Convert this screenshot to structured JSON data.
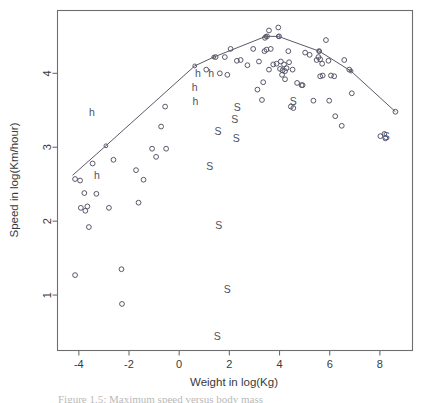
{
  "figure": {
    "caption": "Figure 1.5: Maximum speed versus body mass",
    "background": "#ffffff",
    "frame_color": "#6e6e6e",
    "point_color": "#4f4f62",
    "line_color": "#5a5a6a",
    "text_color": "#3a3a3a"
  },
  "chart_data": {
    "type": "scatter",
    "title": "",
    "xlabel": "Weight in log(Kg)",
    "ylabel": "Speed in log(Km/hour)",
    "xlim": [
      -4.85,
      9.3
    ],
    "ylim": [
      0.25,
      4.85
    ],
    "xticks": [
      -4,
      -2,
      0,
      2,
      4,
      6,
      8
    ],
    "xticklabels": [
      "-4",
      "-2",
      "0",
      "2",
      "4",
      "6",
      "8"
    ],
    "yticks": [
      1,
      2,
      3,
      4
    ],
    "yticklabels": [
      "1",
      "2",
      "3",
      "4"
    ],
    "grid": false,
    "legend": null,
    "series": [
      {
        "name": "observations",
        "marker": "open-circle",
        "points": [
          [
            -4.15,
            2.57
          ],
          [
            -3.95,
            2.55
          ],
          [
            -3.78,
            2.38
          ],
          [
            -3.92,
            2.18
          ],
          [
            -3.74,
            2.14
          ],
          [
            -3.66,
            2.2
          ],
          [
            -3.6,
            1.92
          ],
          [
            -4.15,
            1.27
          ],
          [
            -3.45,
            2.78
          ],
          [
            -3.3,
            2.37
          ],
          [
            -2.8,
            2.18
          ],
          [
            -2.62,
            2.83
          ],
          [
            -2.3,
            1.35
          ],
          [
            -2.28,
            0.88
          ],
          [
            -1.72,
            2.69
          ],
          [
            -1.62,
            2.25
          ],
          [
            -1.42,
            2.56
          ],
          [
            -1.08,
            2.98
          ],
          [
            -0.92,
            2.87
          ],
          [
            -0.72,
            3.28
          ],
          [
            -0.52,
            2.98
          ],
          [
            -0.56,
            3.55
          ],
          [
            1.08,
            4.05
          ],
          [
            1.45,
            4.22
          ],
          [
            1.62,
            4.0
          ],
          [
            1.92,
            3.98
          ],
          [
            2.3,
            4.17
          ],
          [
            2.72,
            4.11
          ],
          [
            2.95,
            4.33
          ],
          [
            3.18,
            4.16
          ],
          [
            3.4,
            4.3
          ],
          [
            3.48,
            4.32
          ],
          [
            3.42,
            4.48
          ],
          [
            3.5,
            4.5
          ],
          [
            3.58,
            4.58
          ],
          [
            3.95,
            4.62
          ],
          [
            3.98,
            4.5
          ],
          [
            3.12,
            3.78
          ],
          [
            3.35,
            3.88
          ],
          [
            3.3,
            3.64
          ],
          [
            3.58,
            4.05
          ],
          [
            3.75,
            4.12
          ],
          [
            3.88,
            4.13
          ],
          [
            4.02,
            4.06
          ],
          [
            4.05,
            4.16
          ],
          [
            4.12,
            4.04
          ],
          [
            4.18,
            4.12
          ],
          [
            4.22,
            4.03
          ],
          [
            4.28,
            4.07
          ],
          [
            4.1,
            3.98
          ],
          [
            4.22,
            3.92
          ],
          [
            4.35,
            4.3
          ],
          [
            4.38,
            4.15
          ],
          [
            4.52,
            4.05
          ],
          [
            4.45,
            3.55
          ],
          [
            4.55,
            3.53
          ],
          [
            4.7,
            3.87
          ],
          [
            4.88,
            3.84
          ],
          [
            4.92,
            3.84
          ],
          [
            5.02,
            4.28
          ],
          [
            5.2,
            4.25
          ],
          [
            5.35,
            3.63
          ],
          [
            5.48,
            4.18
          ],
          [
            5.55,
            4.22
          ],
          [
            5.58,
            4.3
          ],
          [
            5.62,
            4.19
          ],
          [
            5.7,
            4.13
          ],
          [
            5.62,
            3.96
          ],
          [
            5.72,
            3.97
          ],
          [
            5.85,
            4.45
          ],
          [
            5.95,
            4.17
          ],
          [
            5.98,
            3.63
          ],
          [
            6.05,
            3.97
          ],
          [
            6.18,
            3.96
          ],
          [
            6.22,
            3.42
          ],
          [
            6.48,
            3.29
          ],
          [
            6.58,
            4.18
          ],
          [
            6.78,
            4.05
          ],
          [
            6.88,
            3.73
          ],
          [
            8.02,
            3.15
          ],
          [
            8.18,
            3.18
          ],
          [
            8.22,
            3.12
          ],
          [
            8.62,
            3.48
          ],
          [
            3.65,
            4.33
          ],
          [
            2.45,
            4.18
          ],
          [
            2.05,
            4.33
          ],
          [
            1.82,
            4.22
          ]
        ]
      },
      {
        "name": "h-labelled",
        "marker": "letter",
        "label": "h",
        "points": [
          [
            -3.48,
            3.48
          ],
          [
            -3.28,
            2.62
          ],
          [
            0.75,
            4.0
          ],
          [
            0.62,
            3.82
          ],
          [
            0.65,
            3.62
          ],
          [
            1.28,
            4.0
          ]
        ]
      },
      {
        "name": "S-labelled",
        "marker": "letter",
        "label": "S",
        "points": [
          [
            1.55,
            3.22
          ],
          [
            2.32,
            3.55
          ],
          [
            2.22,
            3.38
          ],
          [
            2.28,
            3.12
          ],
          [
            1.22,
            2.75
          ],
          [
            1.58,
            1.95
          ],
          [
            1.92,
            1.08
          ],
          [
            1.52,
            0.45
          ],
          [
            4.55,
            3.62
          ],
          [
            8.25,
            3.15
          ]
        ]
      }
    ],
    "fit_line": {
      "name": "segmented-fit",
      "style": "solid",
      "points": [
        [
          -4.25,
          2.62
        ],
        [
          -2.92,
          3.02
        ],
        [
          0.62,
          4.1
        ],
        [
          1.38,
          4.22
        ],
        [
          3.45,
          4.5
        ],
        [
          3.95,
          4.5
        ],
        [
          5.58,
          4.3
        ],
        [
          6.85,
          4.03
        ],
        [
          8.62,
          3.48
        ]
      ]
    }
  }
}
